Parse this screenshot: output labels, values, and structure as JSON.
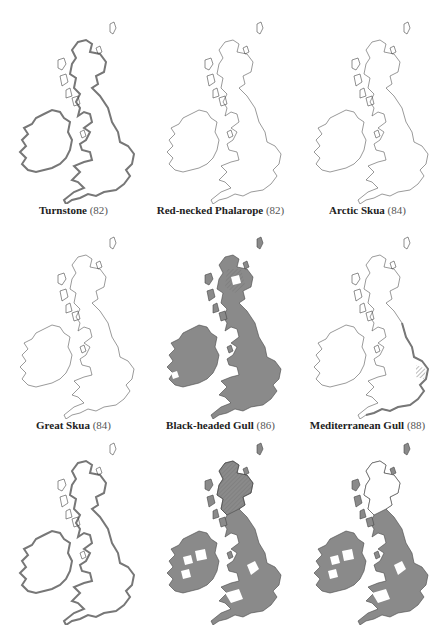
{
  "figure": {
    "panels": [
      {
        "species": "Turnstone",
        "number": "(82)",
        "style": "coastal-thick",
        "fill": "none"
      },
      {
        "species": "Red-necked Phalarope",
        "number": "(82)",
        "style": "outline",
        "fill": "none"
      },
      {
        "species": "Arctic Skua",
        "number": "(84)",
        "style": "outline",
        "fill": "none"
      },
      {
        "species": "Great Skua",
        "number": "(84)",
        "style": "outline",
        "fill": "none"
      },
      {
        "species": "Black-headed Gull",
        "number": "(86)",
        "style": "filled",
        "fill": "widespread"
      },
      {
        "species": "Mediterranean Gull",
        "number": "(88)",
        "style": "coastal-south-east",
        "fill": "none"
      },
      {
        "species": "",
        "number": "",
        "style": "coastal-thick",
        "fill": "none"
      },
      {
        "species": "",
        "number": "",
        "style": "filled",
        "fill": "widespread-with-gaps"
      },
      {
        "species": "",
        "number": "",
        "style": "filled",
        "fill": "widespread-with-gaps-north-empty"
      }
    ],
    "colors": {
      "fill": "#8a8a8a",
      "outline": "#555555",
      "hatch": "#6a6a6a",
      "background": "#ffffff"
    }
  }
}
